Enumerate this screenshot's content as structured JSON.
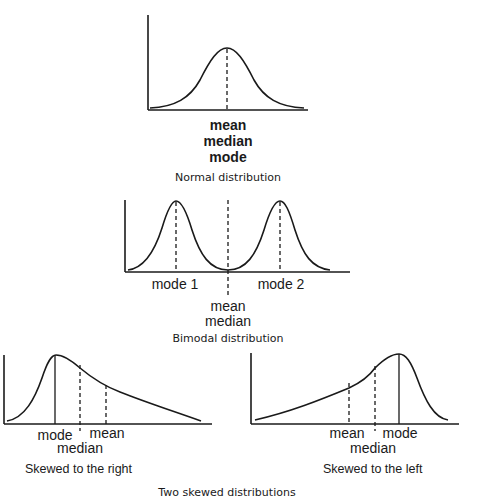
{
  "normal": {
    "labels": [
      "mean",
      "median",
      "mode"
    ],
    "caption": "Normal distribution"
  },
  "bimodal": {
    "mode1_label": "mode 1",
    "mode2_label": "mode 2",
    "center_labels": [
      "mean",
      "median"
    ],
    "caption": "Bimodal distribution"
  },
  "skew_right": {
    "mode_label": "mode",
    "median_label": "median",
    "mean_label": "mean",
    "caption": "Skewed to the right"
  },
  "skew_left": {
    "mean_label": "mean",
    "median_label": "median",
    "mode_label": "mode",
    "caption": "Skewed to the left"
  },
  "footer": {
    "caption": "Two skewed distributions"
  },
  "colors": {
    "ink": "#1a1a1a",
    "background": "#ffffff"
  }
}
